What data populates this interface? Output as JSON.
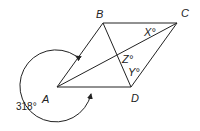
{
  "figure": {
    "type": "geometry-diagram",
    "shape": "rhombus ABCD",
    "vertices": {
      "A": {
        "label": "A",
        "x": 57,
        "y": 87
      },
      "B": {
        "label": "B",
        "x": 103,
        "y": 23
      },
      "C": {
        "label": "C",
        "x": 177,
        "y": 23
      },
      "D": {
        "label": "D",
        "x": 131,
        "y": 87
      }
    },
    "diagonals": [
      "AC",
      "BD"
    ],
    "angles": {
      "x": {
        "label": "X°",
        "location": "angle BCA at C"
      },
      "z": {
        "label": "Z°",
        "location": "angle at diagonal intersection"
      },
      "y": {
        "label": "Y°",
        "location": "angle BDC at D"
      },
      "reflex_a": {
        "label": "318°",
        "location": "reflex angle BAD at A"
      }
    },
    "colors": {
      "stroke": "#222222",
      "background": "#ffffff"
    }
  }
}
